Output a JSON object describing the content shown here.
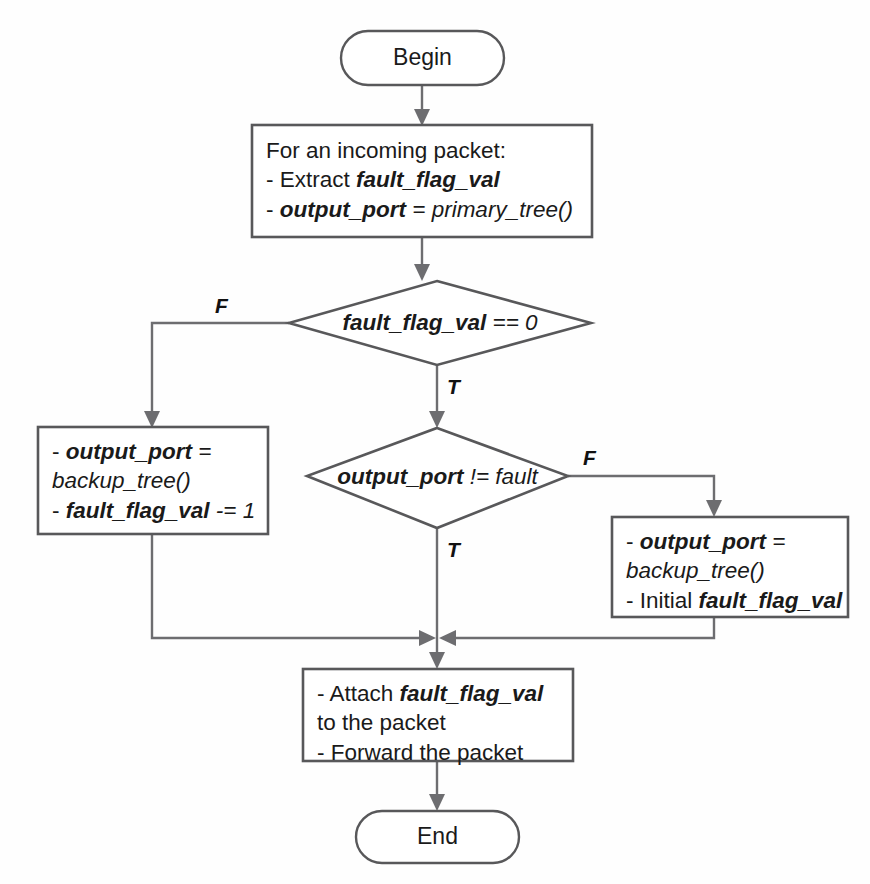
{
  "diagram": {
    "background_color": "#fefefe",
    "line_color": "#6d6d70",
    "shape_stroke_color": "#58585a",
    "text_color": "#1a1a1a"
  },
  "nodes": {
    "begin": {
      "type": "terminator",
      "label": "Begin"
    },
    "extract": {
      "type": "process",
      "lines": [
        {
          "plain_prefix": "For an incoming packet:"
        },
        {
          "plain_prefix": "- Extract ",
          "variable": "fault_flag_val"
        },
        {
          "plain_prefix": "- ",
          "variable": "output_port",
          "operator": " = ",
          "function": "primary_tree()"
        }
      ],
      "text": "For an incoming packet:\n- Extract fault_flag_val\n- output_port = primary_tree()"
    },
    "decision_flag": {
      "type": "decision",
      "variable": "fault_flag_val",
      "operator": " == 0",
      "text": "fault_flag_val == 0",
      "true_label": "T",
      "false_label": "F"
    },
    "backup_decrement": {
      "type": "process",
      "lines": [
        {
          "plain_prefix": "- ",
          "variable": "output_port",
          "operator": " ="
        },
        {
          "function": "backup_tree()"
        },
        {
          "plain_prefix": "- ",
          "variable": "fault_flag_val",
          "operator": " -= 1"
        }
      ],
      "text": "- output_port =\nbackup_tree()\n- fault_flag_val -= 1"
    },
    "decision_port": {
      "type": "decision",
      "variable": "output_port",
      "operator": " != fault",
      "text": "output_port != fault",
      "true_label": "T",
      "false_label": "F"
    },
    "backup_initial": {
      "type": "process",
      "lines": [
        {
          "plain_prefix": "- ",
          "variable": "output_port",
          "operator": " ="
        },
        {
          "function": "backup_tree()"
        },
        {
          "plain_prefix": "- Initial ",
          "variable": "fault_flag_val"
        }
      ],
      "text": "- output_port =\nbackup_tree()\n- Initial fault_flag_val"
    },
    "attach_forward": {
      "type": "process",
      "lines": [
        {
          "plain_prefix": "- Attach ",
          "variable": "fault_flag_val"
        },
        {
          "plain_prefix": "to the packet"
        },
        {
          "plain_prefix": "- Forward the packet"
        }
      ],
      "text": "- Attach fault_flag_val\nto the packet\n- Forward the packet"
    },
    "end": {
      "type": "terminator",
      "label": "End"
    }
  },
  "edge_labels": {
    "flag_false": "F",
    "flag_true": "T",
    "port_false": "F",
    "port_true": "T"
  }
}
